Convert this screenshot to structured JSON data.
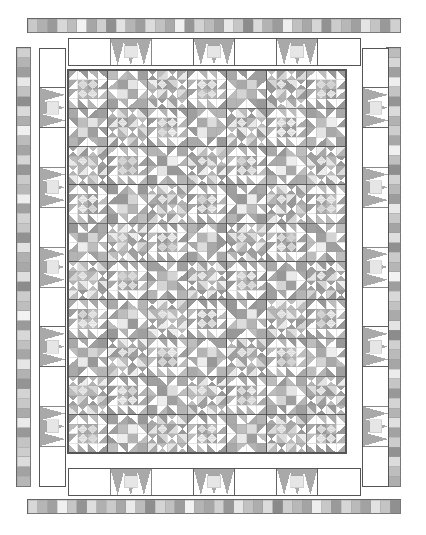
{
  "document": {
    "type": "quilt-design-diagram",
    "title": "Quilt Layout Diagram",
    "width": 426,
    "height": 535
  },
  "palette": {
    "white": "#ffffff",
    "light_gray": "#dcdcdc",
    "light_gray_2": "#e6e6e6",
    "medium_gray": "#a9a9a9",
    "medium_gray_2": "#b8b8b8",
    "dark_gray": "#8f8f8f",
    "darker_gray": "#7d7d7d",
    "outline": "#555555",
    "thin_line": "#9a9a9a",
    "seam_line": "#444444"
  },
  "sections": {
    "outer_checker_top": {
      "name": "Outer checkerboard strip - top",
      "x": 28,
      "y": 19,
      "width": 372,
      "height": 13,
      "cells": 38,
      "values": [
        "#c9c9c9",
        "#b0b0b0",
        "#9a9a9a",
        "#d8d8d8",
        "#bdbdbd",
        "#f2f2f2",
        "#a6a6a6",
        "#cfcfcf",
        "#8f8f8f",
        "#e2e2e2",
        "#b5b5b5",
        "#9e9e9e",
        "#dcdcdc",
        "#c2c2c2",
        "#aaaaaa",
        "#f0f0f0",
        "#969696",
        "#d2d2d2",
        "#bbbbbb",
        "#a2a2a2",
        "#e8e8e8",
        "#c6c6c6",
        "#8c8c8c",
        "#dadada",
        "#b3b3b3",
        "#9c9c9c",
        "#eeeeee",
        "#c0c0c0",
        "#a8a8a8",
        "#d6d6d6",
        "#929292",
        "#cccccc",
        "#b7b7b7",
        "#a0a0a0",
        "#e4e4e4",
        "#c4c4c4",
        "#999999",
        "#d0d0d0"
      ]
    },
    "outer_checker_bottom": {
      "name": "Outer checkerboard strip - bottom",
      "x": 28,
      "y": 500,
      "width": 372,
      "height": 13,
      "cells": 38,
      "values": [
        "#d8d8d8",
        "#b6b6b6",
        "#a0a0a0",
        "#f0f0f0",
        "#c6c6c6",
        "#949494",
        "#dedede",
        "#b0b0b0",
        "#cacaca",
        "#a8a8a8",
        "#eaeaea",
        "#bcbcbc",
        "#8e8e8e",
        "#d4d4d4",
        "#c0c0c0",
        "#9c9c9c",
        "#f2f2f2",
        "#b4b4b4",
        "#a6a6a6",
        "#d0d0d0",
        "#979797",
        "#e6e6e6",
        "#c2c2c2",
        "#aeaeae",
        "#dcdcdc",
        "#8a8a8a",
        "#cecece",
        "#b8b8b8",
        "#a4a4a4",
        "#eeeeee",
        "#c8c8c8",
        "#9a9a9a",
        "#d6d6d6",
        "#bababa",
        "#a2a2a2",
        "#e2e2e2",
        "#c4c4c4",
        "#909090"
      ]
    },
    "outer_checker_left": {
      "name": "Outer checkerboard strip - left",
      "x": 17,
      "y": 48,
      "width": 13,
      "height": 438,
      "cells": 45,
      "values": [
        "#d0d0d0",
        "#b4b4b4",
        "#9e9e9e",
        "#e8e8e8",
        "#c2c2c2",
        "#8e8e8e",
        "#dadada",
        "#aeaeae",
        "#f0f0f0",
        "#bcbcbc",
        "#a4a4a4",
        "#d6d6d6",
        "#969696",
        "#cacaca",
        "#b8b8b8",
        "#eeeeee",
        "#a0a0a0",
        "#d2d2d2",
        "#c6c6c6",
        "#929292",
        "#e2e2e2",
        "#b0b0b0",
        "#a8a8a8",
        "#dedede",
        "#8c8c8c",
        "#cccccc",
        "#bebebe",
        "#f2f2f2",
        "#9a9a9a",
        "#d8d8d8",
        "#c0c0c0",
        "#a6a6a6",
        "#e6e6e6",
        "#b2b2b2",
        "#949494",
        "#d4d4d4",
        "#c8c8c8",
        "#aaaaaa",
        "#eaeaea",
        "#989898",
        "#c4c4c4",
        "#babababa",
        "#dcdcdc",
        "#a2a2a2",
        "#b6b6b6"
      ]
    },
    "outer_checker_right": {
      "name": "Outer checkerboard strip - right",
      "x": 387,
      "y": 48,
      "width": 13,
      "height": 438,
      "cells": 45,
      "values": [
        "#bcbcbc",
        "#d6d6d6",
        "#a0a0a0",
        "#eeeeee",
        "#c4c4c4",
        "#949494",
        "#dadada",
        "#b2b2b2",
        "#cecece",
        "#a8a8a8",
        "#f0f0f0",
        "#c0c0c0",
        "#8e8e8e",
        "#d2d2d2",
        "#b8b8b8",
        "#9c9c9c",
        "#e8e8e8",
        "#c8c8c8",
        "#a4a4a4",
        "#dedede",
        "#909090",
        "#cacaca",
        "#b6b6b6",
        "#f2f2f2",
        "#9e9e9e",
        "#d8d8d8",
        "#c2c2c2",
        "#aaaaaa",
        "#e4e4e4",
        "#8c8c8c",
        "#d0d0d0",
        "#bababa",
        "#a6a6a6",
        "#ececec",
        "#c6c6c6",
        "#989898",
        "#d4d4d4",
        "#b4b4b4",
        "#e0e0e0",
        "#a2a2a2",
        "#cccccc",
        "#929292",
        "#dcdcdc",
        "#bebebe",
        "#aeaeae"
      ]
    },
    "star_border_top": {
      "name": "Pieced star border - top",
      "x": 68,
      "y": 38,
      "width": 292,
      "height": 27,
      "units": [
        {
          "type": "plain",
          "span": 1
        },
        {
          "type": "star",
          "span": 1
        },
        {
          "type": "plain",
          "span": 1
        },
        {
          "type": "star",
          "span": 1
        },
        {
          "type": "plain",
          "span": 1
        },
        {
          "type": "star",
          "span": 1
        },
        {
          "type": "plain",
          "span": 1
        }
      ]
    },
    "star_border_bottom": {
      "name": "Pieced star border - bottom",
      "x": 68,
      "y": 468,
      "width": 292,
      "height": 27,
      "units": [
        {
          "type": "plain",
          "span": 1
        },
        {
          "type": "star",
          "span": 1
        },
        {
          "type": "plain",
          "span": 1
        },
        {
          "type": "star",
          "span": 1
        },
        {
          "type": "plain",
          "span": 1
        },
        {
          "type": "star",
          "span": 1
        },
        {
          "type": "plain",
          "span": 1
        }
      ]
    },
    "star_border_left": {
      "name": "Pieced star border - left",
      "x": 39,
      "y": 48,
      "width": 26,
      "height": 438,
      "units": [
        {
          "type": "plain"
        },
        {
          "type": "star"
        },
        {
          "type": "plain"
        },
        {
          "type": "star"
        },
        {
          "type": "plain"
        },
        {
          "type": "star"
        },
        {
          "type": "plain"
        },
        {
          "type": "star"
        },
        {
          "type": "plain"
        },
        {
          "type": "star"
        },
        {
          "type": "plain"
        }
      ]
    },
    "star_border_right": {
      "name": "Pieced star border - right",
      "x": 362,
      "y": 48,
      "width": 26,
      "height": 438,
      "units": [
        {
          "type": "plain"
        },
        {
          "type": "star"
        },
        {
          "type": "plain"
        },
        {
          "type": "star"
        },
        {
          "type": "plain"
        },
        {
          "type": "star"
        },
        {
          "type": "plain"
        },
        {
          "type": "star"
        },
        {
          "type": "plain"
        },
        {
          "type": "star"
        },
        {
          "type": "plain"
        }
      ]
    },
    "quilt_center": {
      "name": "Quilt center field",
      "x": 68,
      "y": 70,
      "width": 278,
      "height": 383,
      "blocks_across": 7,
      "blocks_down": 10,
      "block_size": 39.7,
      "sub_grid": 4,
      "description": "Sampler of nine-patch / star / half-square-triangle blocks"
    }
  },
  "legend": {
    "fabric_1": "medium gray print",
    "fabric_2": "light gray print",
    "fabric_3": "background white",
    "fabric_4": "dark gray print"
  }
}
